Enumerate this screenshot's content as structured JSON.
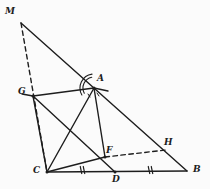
{
  "figure": {
    "kind": "geometry-diagram",
    "caption": "",
    "background_color": "#fbfbfb",
    "stroke_color": "#1d1d1d",
    "width": 210,
    "height": 189
  },
  "points": [
    {
      "id": "M",
      "label": "M",
      "x": 21,
      "y": 23,
      "label_x": 5,
      "label_y": 7
    },
    {
      "id": "A",
      "label": "A",
      "x": 94,
      "y": 88,
      "label_x": 97,
      "label_y": 74
    },
    {
      "id": "G",
      "label": "G",
      "x": 33,
      "y": 96,
      "label_x": 18,
      "label_y": 87
    },
    {
      "id": "C",
      "label": "C",
      "x": 47,
      "y": 172,
      "label_x": 33,
      "label_y": 166
    },
    {
      "id": "D",
      "label": "D",
      "x": 115,
      "y": 172,
      "label_x": 112,
      "label_y": 175
    },
    {
      "id": "B",
      "label": "B",
      "x": 187,
      "y": 171,
      "label_x": 193,
      "label_y": 165
    },
    {
      "id": "F",
      "label": "F",
      "x": 105,
      "y": 157,
      "label_x": 106,
      "label_y": 146
    },
    {
      "id": "H",
      "label": "H",
      "x": 166,
      "y": 150,
      "label_x": 164,
      "label_y": 138
    }
  ],
  "segments": [
    {
      "name": "M-B",
      "from": "M",
      "to": "B",
      "style": "solid"
    },
    {
      "name": "C-B",
      "from": "C",
      "to": "B",
      "style": "solid"
    },
    {
      "name": "M-C",
      "from": "M",
      "to": "C",
      "style": "dashed"
    },
    {
      "name": "G-A",
      "from": "G",
      "to": "A",
      "style": "solid"
    },
    {
      "name": "G-C",
      "from": "G",
      "to": "C",
      "style": "solid"
    },
    {
      "name": "A-F",
      "from": "A",
      "to": "F",
      "style": "solid"
    },
    {
      "name": "C-F",
      "from": "C",
      "to": "F",
      "style": "solid"
    },
    {
      "name": "C-A",
      "from": "C",
      "to": "A",
      "style": "solid"
    },
    {
      "name": "G-D",
      "from": "G",
      "to": "D",
      "style": "solid"
    },
    {
      "name": "F-H",
      "from": "F",
      "to": "H",
      "style": "dashed"
    }
  ],
  "extensions": [
    {
      "name": "G-left-stub",
      "x1": 22,
      "y1": 94,
      "x2": 33,
      "y2": 96,
      "style": "solid"
    },
    {
      "name": "A-right-stub",
      "x1": 94,
      "y1": 88,
      "x2": 108,
      "y2": 91,
      "style": "solid"
    }
  ],
  "marks": {
    "angle_arcs": [
      {
        "name": "angle-arc-at-A-outer",
        "cx": 94,
        "cy": 88,
        "r": 14,
        "start_deg": 150,
        "end_deg": 262
      },
      {
        "name": "angle-arc-at-A-inner",
        "cx": 94,
        "cy": 88,
        "r": 11,
        "start_deg": 152,
        "end_deg": 258
      }
    ],
    "angle_ticks": [
      {
        "name": "angle-tick-left-of-A",
        "x1": 88,
        "y1": 94,
        "x2": 90,
        "y2": 97
      },
      {
        "name": "angle-tick-right-of-A",
        "x1": 97,
        "y1": 93,
        "x2": 99,
        "y2": 96
      }
    ],
    "congruence_ticks": [
      {
        "name": "tick-CD-1",
        "cx": 81,
        "cy": 170,
        "angle_deg": 78
      },
      {
        "name": "tick-CD-2",
        "cx": 84,
        "cy": 170,
        "angle_deg": 78
      },
      {
        "name": "tick-DB-1",
        "cx": 149,
        "cy": 170,
        "angle_deg": 78
      },
      {
        "name": "tick-DB-2",
        "cx": 152,
        "cy": 170,
        "angle_deg": 78
      }
    ]
  }
}
